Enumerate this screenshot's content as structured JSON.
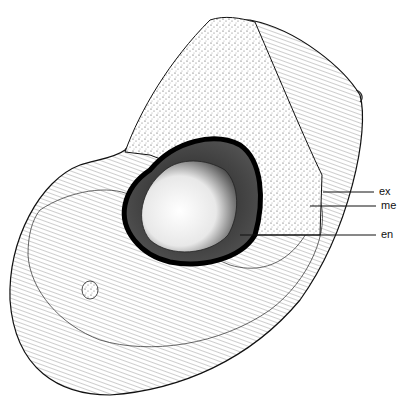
{
  "figure": {
    "labels": [
      {
        "id": "ex",
        "text": "ex",
        "x": 379,
        "y": 187
      },
      {
        "id": "me",
        "text": "me",
        "x": 381,
        "y": 201
      },
      {
        "id": "en",
        "text": "en",
        "x": 381,
        "y": 230
      }
    ]
  }
}
